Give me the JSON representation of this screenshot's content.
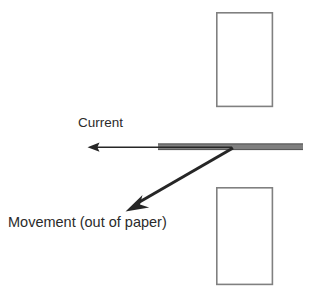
{
  "diagram": {
    "background_color": "#ffffff",
    "labels": {
      "current": "Current",
      "movement": "Movement (out of paper)"
    },
    "colors": {
      "magnet_outline": "#808080",
      "magnet_fill": "#ffffff",
      "conductor_bar": "#7f7f7f",
      "conductor_bar_edge": "#595959",
      "arrow": "#262626",
      "text": "#2b2b2b"
    },
    "shapes": {
      "top_magnet": {
        "x": 216,
        "y": 12,
        "width": 57,
        "height": 95
      },
      "bottom_magnet": {
        "x": 216,
        "y": 187,
        "width": 57,
        "height": 98
      },
      "conductor_bar": {
        "x": 158,
        "y": 143,
        "width": 145,
        "height": 7
      }
    },
    "arrows": {
      "current": {
        "name": "current-arrow",
        "direction": "left",
        "from_x": 232,
        "from_y": 147,
        "to_x": 88,
        "to_y": 147
      },
      "movement": {
        "name": "movement-arrow",
        "direction": "down-left",
        "from_x": 233,
        "from_y": 148,
        "to_x": 126,
        "to_y": 212
      }
    }
  }
}
